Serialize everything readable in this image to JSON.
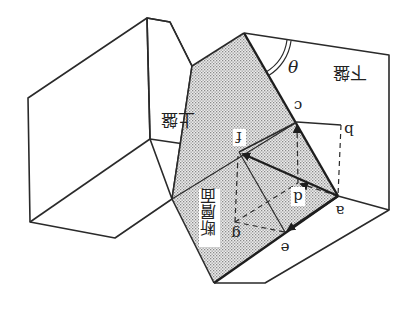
{
  "diagram": {
    "orientation": "rotated 180 degrees",
    "colors": {
      "line": "#2a2a2a",
      "fault_plane_fill": "#d9d9d9",
      "background": "#ffffff"
    },
    "labels": {
      "hanging_wall": "上盤",
      "footwall": "下盤",
      "fault_plane": "断層面",
      "dip_angle": "θ"
    },
    "points": {
      "a": "a",
      "b": "b",
      "c": "c",
      "d": "d",
      "e": "e",
      "f": "f",
      "g": "g"
    },
    "arrows": [
      {
        "from": "a",
        "to": "f",
        "style": "solid-thick"
      },
      {
        "from": "a",
        "to": "e",
        "style": "solid"
      },
      {
        "from": "a",
        "to": "d",
        "style": "dashed"
      },
      {
        "from": "d",
        "to": "c",
        "style": "dashed"
      },
      {
        "from": "g",
        "to": "f",
        "style": "dashed"
      }
    ]
  }
}
